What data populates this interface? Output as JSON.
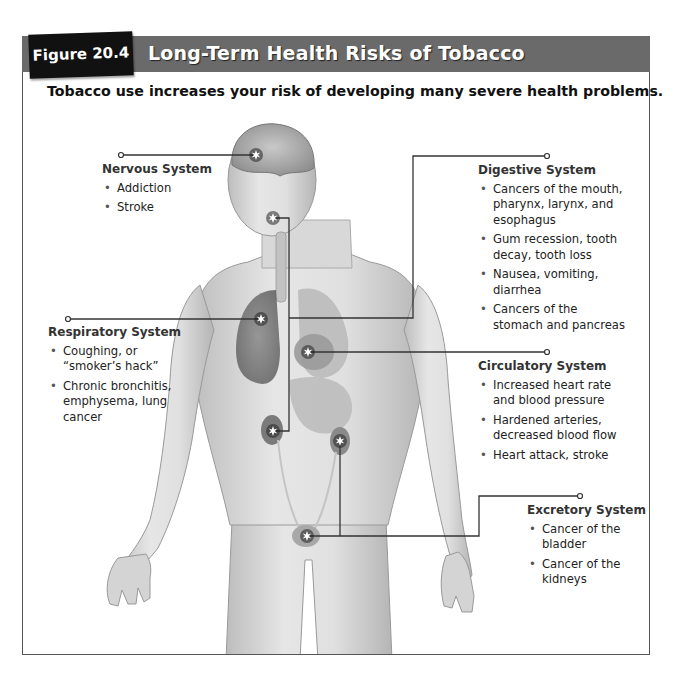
{
  "figure": {
    "number": "Figure 20.4",
    "title": "Long-Term Health Risks of Tobacco",
    "subtitle": "Tobacco use increases your risk of developing many severe health problems."
  },
  "colors": {
    "header_bar": "#6a6a6a",
    "figure_tab": "#111111",
    "leader_line": "#333333",
    "marker": "#ffffff"
  },
  "systems": {
    "nervous": {
      "name": "Nervous System",
      "effects": [
        "Addiction",
        "Stroke"
      ],
      "marker_icon": "starburst-marker-brain"
    },
    "respiratory": {
      "name": "Respiratory System",
      "effects": [
        "Coughing, or “smoker’s hack”",
        "Chronic bronchitis, emphysema, lung cancer"
      ],
      "marker_icon": "starburst-marker-lungs"
    },
    "digestive": {
      "name": "Digestive System",
      "effects": [
        "Cancers of the mouth, pharynx, larynx, and esophagus",
        "Gum recession, tooth decay, tooth loss",
        "Nausea, vomiting, diarrhea",
        "Cancers of the stomach and pancreas"
      ],
      "marker_icon": "starburst-marker-mouth"
    },
    "circulatory": {
      "name": "Circulatory System",
      "effects": [
        "Increased heart rate and blood pressure",
        "Hardened arteries, decreased blood flow",
        "Heart attack, stroke"
      ],
      "marker_icon": "starburst-marker-heart"
    },
    "excretory": {
      "name": "Excretory System",
      "effects": [
        "Cancer of the bladder",
        "Cancer of the kidneys"
      ],
      "marker_icon": "starburst-marker-bladder"
    }
  }
}
